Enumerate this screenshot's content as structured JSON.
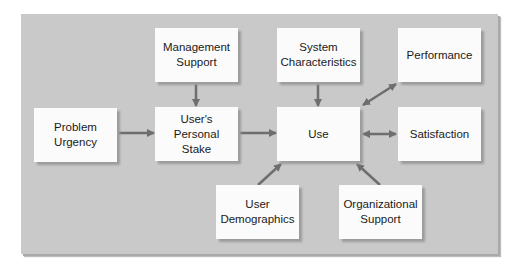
{
  "diagram": {
    "nodes": {
      "management_support": "Management\nSupport",
      "system_characteristics": "System\nCharacteristics",
      "performance": "Performance",
      "problem_urgency": "Problem\nUrgency",
      "users_personal_stake": "User's\nPersonal\nStake",
      "use": "Use",
      "satisfaction": "Satisfaction",
      "user_demographics": "User\nDemographics",
      "organizational_support": "Organizational\nSupport"
    },
    "edges": [
      {
        "from": "Problem Urgency",
        "to": "User's Personal Stake",
        "type": "directed"
      },
      {
        "from": "Management Support",
        "to": "User's Personal Stake",
        "type": "directed"
      },
      {
        "from": "User's Personal Stake",
        "to": "Use",
        "type": "directed"
      },
      {
        "from": "System Characteristics",
        "to": "Use",
        "type": "directed"
      },
      {
        "from": "User Demographics",
        "to": "Use",
        "type": "directed"
      },
      {
        "from": "Organizational Support",
        "to": "Use",
        "type": "directed"
      },
      {
        "from": "Use",
        "to": "Performance",
        "type": "bidirectional"
      },
      {
        "from": "Use",
        "to": "Satisfaction",
        "type": "bidirectional"
      }
    ],
    "colors": {
      "panel": "#c9c9c9",
      "box": "#fbfbfb",
      "arrow": "#6e6e6e"
    }
  }
}
